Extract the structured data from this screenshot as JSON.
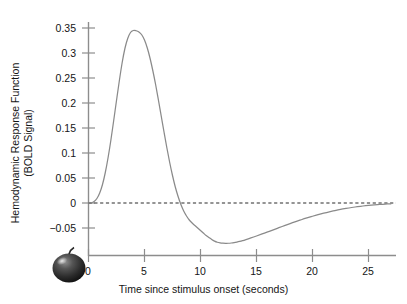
{
  "figure": {
    "background_color": "#ffffff",
    "curve_color": "#8a8a8a",
    "axis_color": "#8d8d8d",
    "text_color": "#151515"
  },
  "axes": {
    "x_title": "Time since stimulus onset (seconds)",
    "y_title_line1": "Hemodynamic Response Function",
    "y_title_line2": "(BOLD Signal)",
    "x_ticks": [
      "0",
      "5",
      "10",
      "15",
      "20",
      "25"
    ],
    "y_ticks": [
      "0.35",
      "0.3",
      "0.25",
      "0.2",
      "0.15",
      "0.1",
      "0.05",
      "0",
      "−0.05"
    ]
  },
  "icons": {
    "apple": "apple-icon"
  },
  "chart_data": {
    "type": "line",
    "title": "",
    "xlabel": "Time since stimulus onset (seconds)",
    "ylabel": "Hemodynamic Response Function (BOLD Signal)",
    "xlim": [
      0,
      27
    ],
    "ylim": [
      -0.085,
      0.36
    ],
    "xticks": [
      0,
      5,
      10,
      15,
      20,
      25
    ],
    "yticks": [
      -0.05,
      0,
      0.05,
      0.1,
      0.15,
      0.2,
      0.25,
      0.3,
      0.35
    ],
    "grid": false,
    "legend": null,
    "annotations": [
      {
        "name": "zero-reference-line",
        "type": "hline",
        "y": 0,
        "style": "dashed"
      }
    ],
    "features": {
      "onset_delay_s": 1.0,
      "peak_time_s": 4.8,
      "peak_value": 0.345,
      "zero_crossing_s": 9.4,
      "undershoot_time_s": 12.5,
      "undershoot_value": -0.08,
      "return_to_baseline_s": 24.0
    },
    "series": [
      {
        "name": "Hemodynamic Response Function",
        "color": "#8a8a8a",
        "x": [
          0,
          0.25,
          0.5,
          0.75,
          1,
          1.25,
          1.5,
          1.75,
          2,
          2.25,
          2.5,
          2.75,
          3,
          3.25,
          3.5,
          3.75,
          4,
          4.25,
          4.5,
          4.75,
          5,
          5.25,
          5.5,
          5.75,
          6,
          6.25,
          6.5,
          6.75,
          7,
          7.25,
          7.5,
          7.75,
          8,
          8.25,
          8.5,
          8.75,
          9,
          9.25,
          9.5,
          9.75,
          10,
          10.25,
          10.5,
          10.75,
          11,
          11.25,
          11.5,
          11.75,
          12,
          12.25,
          12.5,
          12.75,
          13,
          13.25,
          13.5,
          13.75,
          14,
          14.5,
          15,
          15.5,
          16,
          16.5,
          17,
          17.5,
          18,
          18.5,
          19,
          19.5,
          20,
          20.5,
          21,
          21.5,
          22,
          22.5,
          23,
          23.5,
          24,
          24.5,
          25,
          25.5,
          26,
          26.5,
          27
        ],
        "y": [
          0,
          0.0005,
          0.003,
          0.009,
          0.02,
          0.037,
          0.061,
          0.091,
          0.126,
          0.165,
          0.205,
          0.244,
          0.28,
          0.309,
          0.329,
          0.341,
          0.345,
          0.3445,
          0.342,
          0.3365,
          0.326,
          0.31,
          0.289,
          0.264,
          0.236,
          0.205,
          0.173,
          0.141,
          0.11,
          0.081,
          0.055,
          0.032,
          0.013,
          -0.003,
          -0.016,
          -0.026,
          -0.034,
          -0.04,
          -0.045,
          -0.05,
          -0.055,
          -0.06,
          -0.065,
          -0.069,
          -0.073,
          -0.0762,
          -0.0785,
          -0.0798,
          -0.0804,
          -0.0806,
          -0.0805,
          -0.08,
          -0.0792,
          -0.0781,
          -0.0768,
          -0.0753,
          -0.0736,
          -0.0699,
          -0.066,
          -0.0619,
          -0.0578,
          -0.0536,
          -0.0494,
          -0.0453,
          -0.0412,
          -0.0373,
          -0.0335,
          -0.0299,
          -0.0265,
          -0.0233,
          -0.0203,
          -0.0176,
          -0.0151,
          -0.0128,
          -0.0108,
          -0.009,
          -0.0074,
          -0.006,
          -0.0048,
          -0.0038,
          -0.0029,
          -0.0022,
          -0.0016
        ]
      }
    ]
  }
}
